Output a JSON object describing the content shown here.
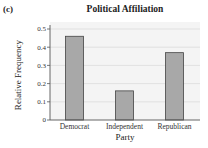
{
  "panel_label": "(c)",
  "chart_data": {
    "type": "bar",
    "title": "Political Affiliation",
    "xlabel": "Party",
    "ylabel": "Relative Frequency",
    "categories": [
      "Democrat",
      "Independent",
      "Republican"
    ],
    "values": [
      0.46,
      0.16,
      0.37
    ],
    "ylim": [
      0,
      0.5
    ],
    "yticks": [
      "0",
      "0.1",
      "0.2",
      "0.3",
      "0.4",
      "0.5"
    ],
    "grid": true,
    "legend": null
  },
  "colors": {
    "bar_fill": "#a8a8a8",
    "bar_stroke": "#444444",
    "plot_bg": "#f4f4f4",
    "grid": "#dcdcdc",
    "axis": "#555555"
  }
}
